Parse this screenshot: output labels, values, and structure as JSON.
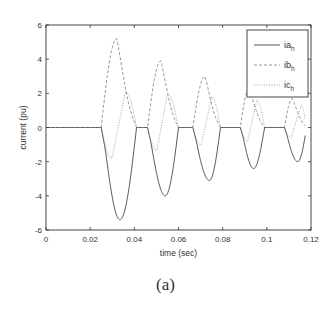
{
  "caption": "(a)",
  "chart_data": {
    "type": "line",
    "title": "",
    "xlabel": "time (sec)",
    "ylabel": "current (pu)",
    "xlim": [
      0,
      0.12
    ],
    "ylim": [
      -6,
      6
    ],
    "xticks": [
      0,
      0.02,
      0.04,
      0.06,
      0.08,
      0.1,
      0.12
    ],
    "xtick_labels": [
      "0",
      "0.02",
      "0.04",
      "0.06",
      "0.08",
      "0.1",
      "0.12"
    ],
    "yticks": [
      -6,
      -4,
      -2,
      0,
      2,
      4,
      6
    ],
    "ytick_labels": [
      "-6",
      "-4",
      "-2",
      "0",
      "2",
      "4",
      "6"
    ],
    "grid": false,
    "legend_position": "upper right",
    "pulses": [
      {
        "start": 0.025,
        "end": 0.041,
        "ib_peak": 5.2,
        "ib_peak_t": 0.032,
        "ia_min": -5.4,
        "ia_min_t": 0.0335,
        "ic_peak": 2.1,
        "ic_peak_t": 0.036
      },
      {
        "start": 0.046,
        "end": 0.06,
        "ib_peak": 3.9,
        "ib_peak_t": 0.052,
        "ia_min": -4.0,
        "ia_min_t": 0.054,
        "ic_peak": 2.0,
        "ic_peak_t": 0.055
      },
      {
        "start": 0.0665,
        "end": 0.079,
        "ib_peak": 3.0,
        "ib_peak_t": 0.072,
        "ia_min": -3.1,
        "ia_min_t": 0.074,
        "ic_peak": 1.8,
        "ic_peak_t": 0.075
      },
      {
        "start": 0.088,
        "end": 0.099,
        "ib_peak": 2.3,
        "ib_peak_t": 0.092,
        "ia_min": -2.4,
        "ia_min_t": 0.094,
        "ic_peak": 1.6,
        "ic_peak_t": 0.0955
      },
      {
        "start": 0.108,
        "end": 0.118,
        "ib_peak": 1.7,
        "ib_peak_t": 0.1115,
        "ia_min": -2.0,
        "ia_min_t": 0.114,
        "ic_peak": 1.3,
        "ic_peak_t": 0.1155
      }
    ],
    "series": [
      {
        "name": "ia",
        "subscript": "h",
        "style": "solid",
        "color": "#444444"
      },
      {
        "name": "ib",
        "subscript": "h",
        "style": "dashed",
        "color": "#888888"
      },
      {
        "name": "ic",
        "subscript": "h",
        "style": "dotted",
        "color": "#999999"
      }
    ]
  }
}
